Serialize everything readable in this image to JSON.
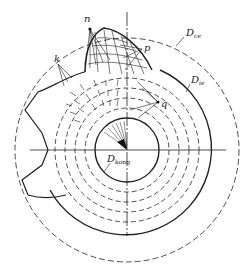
{
  "diagram": {
    "labels": {
      "n": "n",
      "p": "p",
      "k": "k",
      "q": "q",
      "d_ce": "D",
      "d_ce_sub": "ce",
      "d_ie": "D",
      "d_ie_sub": "ie",
      "d_kong": "D",
      "d_kong_sub": "kong"
    },
    "colors": {
      "stroke": "#222222",
      "background": "#ffffff"
    }
  }
}
